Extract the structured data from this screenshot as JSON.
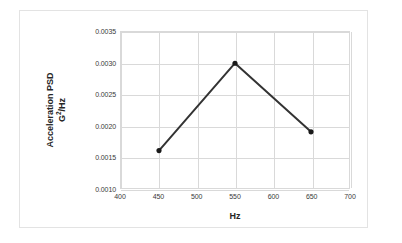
{
  "chart_data": {
    "type": "line",
    "title": "",
    "xlabel": "Hz",
    "ylabel_line1": "Acceleration PSD",
    "ylabel_line2_base": "G",
    "ylabel_line2_sup": "2",
    "ylabel_line2_tail": "/Hz",
    "ylabel": "Acceleration PSD G2/Hz",
    "x": [
      450,
      550,
      650
    ],
    "values": [
      0.0016,
      0.003,
      0.0019
    ],
    "series": [
      {
        "name": "Acceleration PSD",
        "x": [
          450,
          550,
          650
        ],
        "values": [
          0.0016,
          0.003,
          0.0019
        ]
      }
    ],
    "xlim": [
      400,
      700
    ],
    "ylim": [
      0.001,
      0.0035
    ],
    "xticks": [
      400,
      450,
      500,
      550,
      600,
      650,
      700
    ],
    "xtick_labels": [
      "400",
      "450",
      "500",
      "550",
      "600",
      "650",
      "700"
    ],
    "yticks": [
      0.001,
      0.0015,
      0.002,
      0.0025,
      0.003,
      0.0035
    ],
    "ytick_labels": [
      "0.0010",
      "0.0015",
      "0.0020",
      "0.0025",
      "0.0030",
      "0.0035"
    ],
    "grid": true,
    "grid_axes": "both",
    "legend": false,
    "legend_position": "none",
    "marker": "circle",
    "marker_filled": true,
    "line_color": "#333333",
    "marker_color": "#1a1a1a",
    "grid_color": "#d9d9d9",
    "plot_background": "#ffffff",
    "frame_color": "#e3e3e3",
    "tick_label_color": "#3a3a3a",
    "axis_title_color": "#262626"
  }
}
